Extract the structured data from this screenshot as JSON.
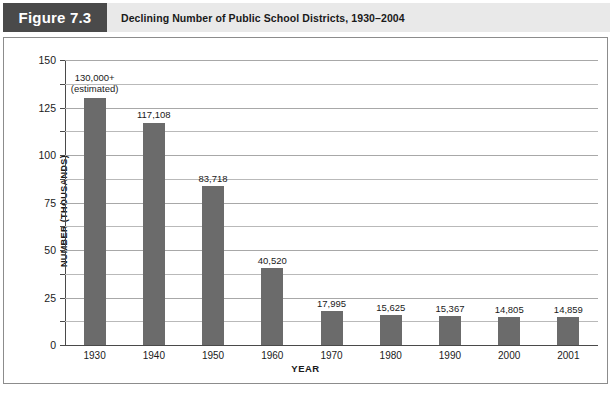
{
  "header": {
    "figure_tag": "Figure 7.3",
    "title": "Declining Number of Public School Districts, 1930–2004"
  },
  "colors": {
    "figure_tag_background": "#4a4a4a",
    "header_band_background": "#e9e9e9",
    "bar_fill": "#6b6b6b",
    "gridline": "#b9b9b9",
    "axis": "#4a4a4a",
    "text": "#1a1a1a",
    "panel_border": "#8c8c8c"
  },
  "chart_data": {
    "type": "bar",
    "title": "Declining Number of Public School Districts, 1930–2004",
    "xlabel": "YEAR",
    "ylabel": "NUMBER (THOUSANDS)",
    "ylim": [
      0,
      150
    ],
    "ytick_labels": [
      "0",
      "25",
      "50",
      "75",
      "100",
      "125",
      "150"
    ],
    "ytick_values": [
      0,
      25,
      50,
      75,
      100,
      125,
      150
    ],
    "gridline_values": [
      0,
      12.5,
      25,
      37.5,
      50,
      62.5,
      75,
      87.5,
      100,
      112.5,
      125,
      137.5,
      150
    ],
    "grid": true,
    "legend": false,
    "categories": [
      "1930",
      "1940",
      "1950",
      "1960",
      "1970",
      "1980",
      "1990",
      "2000",
      "2001"
    ],
    "values": [
      130.0,
      117.108,
      83.718,
      40.52,
      17.995,
      15.625,
      15.367,
      14.805,
      14.859
    ],
    "data_labels": [
      "130,000+\n(estimated)",
      "117,108",
      "83,718",
      "40,520",
      "17,995",
      "15,625",
      "15,367",
      "14,805",
      "14,859"
    ],
    "data_labels_line1": [
      "130,000+",
      "117,108",
      "83,718",
      "40,520",
      "17,995",
      "15,625",
      "15,367",
      "14,805",
      "14,859"
    ],
    "data_labels_line2": [
      "(estimated)",
      "",
      "",
      "",
      "",
      "",
      "",
      "",
      ""
    ]
  }
}
